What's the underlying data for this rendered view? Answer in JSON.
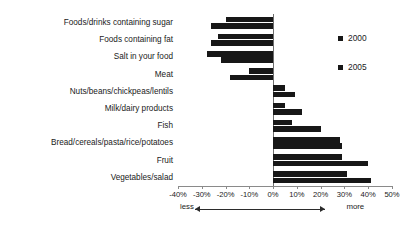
{
  "chart_data": {
    "type": "bar",
    "orientation": "horizontal",
    "title": "",
    "subtitle": "",
    "xlabel": "",
    "ylabel": "",
    "xlim": [
      -40,
      50
    ],
    "grid": false,
    "legend_position": "right",
    "categories": [
      "Foods/drinks containing sugar",
      "Foods containing fat",
      "Salt in your food",
      "Meat",
      "Nuts/beans/chickpeas/lentils",
      "Milk/dairy products",
      "Fish",
      "Bread/cereals/pasta/rice/potatoes",
      "Fruit",
      "Vegetables/salad"
    ],
    "series": [
      {
        "name": "2000",
        "values": [
          -20,
          -23,
          -28,
          -10,
          5,
          5,
          8,
          28,
          29,
          31
        ]
      },
      {
        "name": "2005",
        "values": [
          -26,
          -26,
          -22,
          -18,
          9,
          12,
          20,
          29,
          40,
          41
        ]
      }
    ],
    "tick_labels": [
      "-40%",
      "-30%",
      "-20%",
      "-10%",
      "0%",
      "10%",
      "20%",
      "30%",
      "40%",
      "50%"
    ],
    "tick_values": [
      -40,
      -30,
      -20,
      -10,
      0,
      10,
      20,
      30,
      40,
      50
    ],
    "annotations": {
      "left_label": "less",
      "right_label": "more",
      "arrow_from": -33,
      "arrow_to": 22
    },
    "colors": {
      "bar": "#171717",
      "axis": "#8a8a8a",
      "text": "#1a1a1a",
      "background": "#ffffff"
    }
  }
}
